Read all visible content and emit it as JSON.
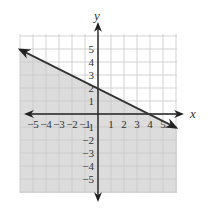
{
  "chart_data": {
    "type": "line",
    "title": "",
    "xlabel": "x",
    "ylabel": "y",
    "xlim": [
      -5.9,
      6.0
    ],
    "ylim": [
      -6.0,
      6.0
    ],
    "grid": true,
    "x_ticks": [
      "-5",
      "-4",
      "-3",
      "-2",
      "-1",
      "1",
      "2",
      "3",
      "4",
      "5"
    ],
    "y_ticks": [
      "5",
      "4",
      "3",
      "2",
      "1",
      "-1",
      "-2",
      "-3",
      "-4",
      "-5"
    ],
    "series": [
      {
        "name": "boundary line y = -x/2 + 2",
        "x": [
          -5.9,
          5.3
        ],
        "y": [
          4.95,
          -0.65
        ],
        "style": "solid",
        "arrows": "both"
      }
    ],
    "shaded_region": "below line (y <= -x/2 + 2)",
    "colors": {
      "shade": "#dcdcdc",
      "grid": "#c8c8c8",
      "line": "#333333",
      "axis": "#222222"
    }
  }
}
